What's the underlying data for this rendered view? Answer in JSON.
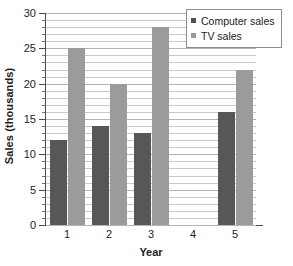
{
  "chart_data": {
    "type": "bar",
    "title": "",
    "subtitle": "",
    "xlabel": "Year",
    "ylabel": "Sales (thousands)",
    "categories": [
      "1",
      "2",
      "3",
      "4",
      "5"
    ],
    "series": [
      {
        "name": "Computer sales",
        "values": [
          12,
          14,
          13,
          0,
          16
        ],
        "color": "#575757"
      },
      {
        "name": "TV sales",
        "values": [
          25,
          20,
          28,
          0,
          22
        ],
        "color": "#9b9b9b"
      }
    ],
    "ylim": [
      0,
      30
    ],
    "y_major_ticks": [
      0,
      5,
      10,
      15,
      20,
      25,
      30
    ],
    "y_minor_tick_step": 1,
    "y_tick_labels": [
      "0",
      "5",
      "10",
      "15",
      "20",
      "25",
      "30"
    ],
    "grid": true,
    "grid_orientation": "horizontal",
    "legend_position": "top-right",
    "annotations": []
  },
  "legend": {
    "entries": [
      {
        "label": "Computer sales",
        "marker": "square-dark"
      },
      {
        "label": "TV sales",
        "marker": "square-light"
      }
    ]
  },
  "axes": {
    "y_title": "Sales (thousands)",
    "x_title": "Year"
  }
}
